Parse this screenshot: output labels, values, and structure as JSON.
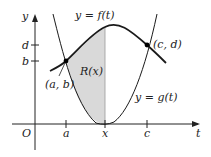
{
  "diagram": {
    "axes": {
      "x_label": "t",
      "y_label": "y",
      "origin_label": "O"
    },
    "x_ticks": [
      {
        "label": "a"
      },
      {
        "label": "x"
      },
      {
        "label": "c"
      }
    ],
    "y_ticks": [
      {
        "label": "d"
      },
      {
        "label": "b"
      }
    ],
    "curves": {
      "f_label": "y = f(t)",
      "g_label": "y = g(t)"
    },
    "points": {
      "ab_label": "(a, b)",
      "cd_label": "(c, d)"
    },
    "region_label": "R(x)",
    "colors": {
      "axis": "#222222",
      "curve": "#1a1a1a",
      "region_fill": "#d9d9d9"
    }
  }
}
